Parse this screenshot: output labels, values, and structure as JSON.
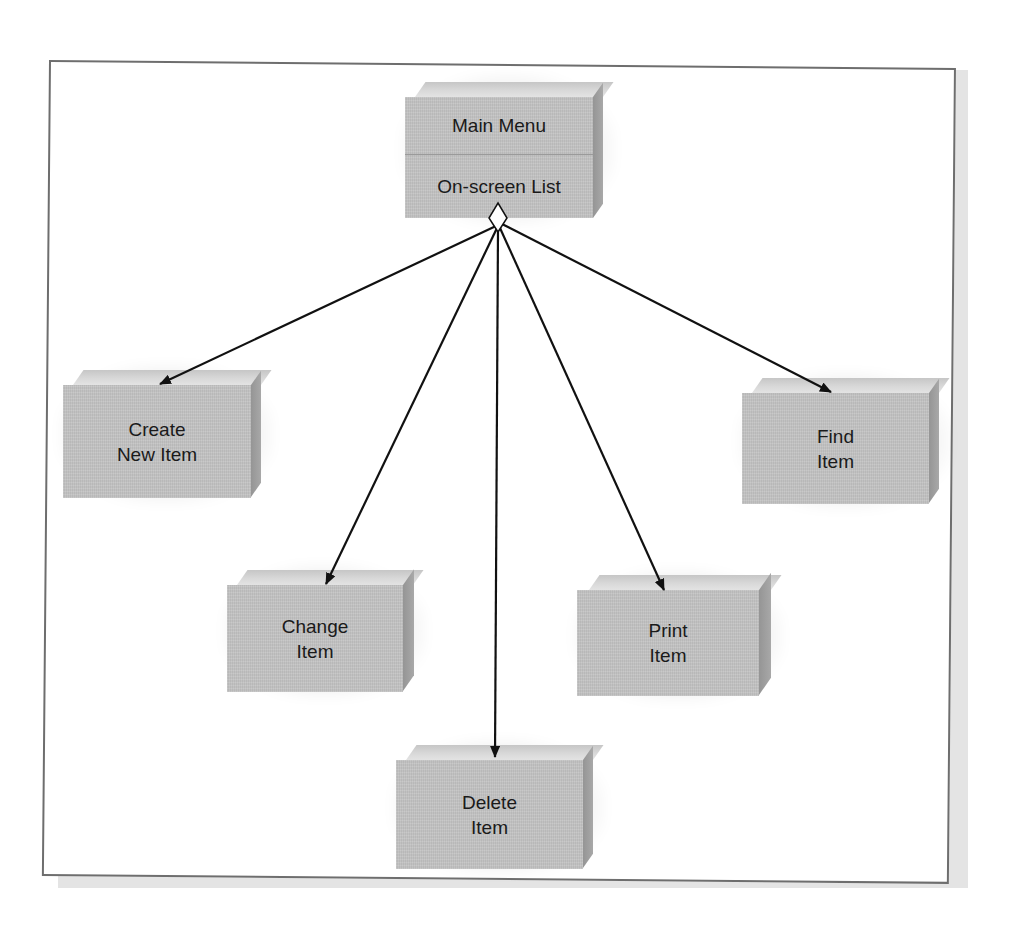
{
  "diagram": {
    "type": "menu-hierarchy",
    "root": {
      "id": "main-menu",
      "sections": [
        "Main Menu",
        "On-screen List"
      ],
      "connector": "diamond"
    },
    "nodes": [
      {
        "id": "create-new-item",
        "lines": [
          "Create",
          "New Item"
        ]
      },
      {
        "id": "change-item",
        "lines": [
          "Change",
          "Item"
        ]
      },
      {
        "id": "delete-item",
        "lines": [
          "Delete",
          "Item"
        ]
      },
      {
        "id": "print-item",
        "lines": [
          "Print",
          "Item"
        ]
      },
      {
        "id": "find-item",
        "lines": [
          "Find",
          "Item"
        ]
      }
    ],
    "edges": [
      {
        "from": "main-menu",
        "to": "create-new-item"
      },
      {
        "from": "main-menu",
        "to": "change-item"
      },
      {
        "from": "main-menu",
        "to": "delete-item"
      },
      {
        "from": "main-menu",
        "to": "print-item"
      },
      {
        "from": "main-menu",
        "to": "find-item"
      }
    ]
  },
  "colors": {
    "box_front": "#c4c4c4",
    "box_top": "#dcdcdc",
    "box_side": "#9e9e9e",
    "arrow": "#111111",
    "frame_border": "#6e6e6e",
    "frame_shadow": "#e4e4e4"
  }
}
